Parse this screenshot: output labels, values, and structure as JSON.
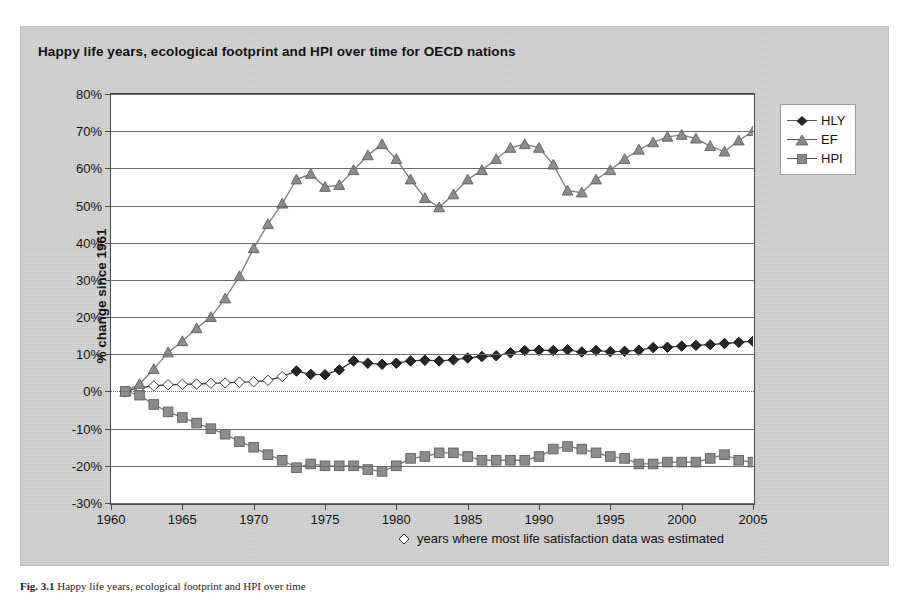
{
  "figure": {
    "title": "Happy life years, ecological footprint and HPI over time for OECD nations",
    "caption_label": "Fig. 3.1",
    "caption_text": "Happy life years, ecological footprint and HPI over time"
  },
  "footnote": {
    "symbol": "◇",
    "text": "years where most life satisfaction data was estimated"
  },
  "legend": {
    "position": "right",
    "items": [
      {
        "label": "HLY",
        "marker": "diamond",
        "color": "#262626"
      },
      {
        "label": "EF",
        "marker": "triangle",
        "color": "#7f7f7f"
      },
      {
        "label": "HPI",
        "marker": "square",
        "color": "#808080"
      }
    ]
  },
  "chart_data": {
    "type": "line",
    "title": "Happy life years, ecological footprint and HPI over time for OECD nations",
    "xlabel": "",
    "ylabel": "% change since 1961",
    "xlim": [
      1960,
      2005
    ],
    "ylim": [
      -30,
      80
    ],
    "ytick_values": [
      80,
      70,
      60,
      50,
      40,
      30,
      20,
      10,
      0,
      -10,
      -20,
      -30
    ],
    "ytick_labels": [
      "80%",
      "70%",
      "60%",
      "50%",
      "40%",
      "30%",
      "20%",
      "10%",
      "0%",
      "-10%",
      "-20%",
      "-30%"
    ],
    "xtick_values": [
      1960,
      1965,
      1970,
      1975,
      1980,
      1985,
      1990,
      1995,
      2000,
      2005
    ],
    "xtick_labels": [
      "1960",
      "1965",
      "1970",
      "1975",
      "1980",
      "1985",
      "1990",
      "1995",
      "2000",
      "2005"
    ],
    "grid": "horizontal",
    "legend_position": "right",
    "x": [
      1961,
      1962,
      1963,
      1964,
      1965,
      1966,
      1967,
      1968,
      1969,
      1970,
      1971,
      1972,
      1973,
      1974,
      1975,
      1976,
      1977,
      1978,
      1979,
      1980,
      1981,
      1982,
      1983,
      1984,
      1985,
      1986,
      1987,
      1988,
      1989,
      1990,
      1991,
      1992,
      1993,
      1994,
      1995,
      1996,
      1997,
      1998,
      1999,
      2000,
      2001,
      2002,
      2003,
      2004,
      2005
    ],
    "series": [
      {
        "name": "HLY",
        "marker": "diamond",
        "color": "#262626",
        "values": [
          0.0,
          1.0,
          1.5,
          1.8,
          1.9,
          2.0,
          2.2,
          2.3,
          2.5,
          2.6,
          3.0,
          4.0,
          5.5,
          4.6,
          4.5,
          5.8,
          8.2,
          7.6,
          7.3,
          7.6,
          8.2,
          8.4,
          8.2,
          8.5,
          9.0,
          9.4,
          9.6,
          10.4,
          11.0,
          11.1,
          11.0,
          11.2,
          10.6,
          11.0,
          10.7,
          10.8,
          11.1,
          11.8,
          11.9,
          12.2,
          12.4,
          12.6,
          12.9,
          13.2,
          13.5
        ],
        "estimated_until": 1972,
        "estimated_note": "open diamonds mark years where most life satisfaction data was estimated"
      },
      {
        "name": "EF",
        "marker": "triangle",
        "color": "#7f7f7f",
        "values": [
          0.0,
          2.0,
          6.0,
          10.5,
          13.5,
          17.0,
          20.0,
          25.0,
          31.0,
          38.5,
          45.0,
          50.5,
          57.0,
          58.5,
          55.0,
          55.5,
          59.5,
          63.5,
          66.5,
          62.5,
          57.0,
          52.0,
          49.5,
          53.0,
          57.0,
          59.5,
          62.5,
          65.5,
          66.5,
          65.5,
          61.0,
          54.0,
          53.5,
          57.0,
          59.5,
          62.5,
          65.0,
          67.0,
          68.5,
          69.0,
          68.0,
          66.0,
          64.5,
          67.5,
          70.0
        ]
      },
      {
        "name": "HPI",
        "marker": "square",
        "color": "#808080",
        "values": [
          0.0,
          -1.0,
          -3.5,
          -5.5,
          -7.0,
          -8.5,
          -10.0,
          -11.5,
          -13.5,
          -15.0,
          -17.0,
          -18.5,
          -20.5,
          -19.5,
          -20.0,
          -20.0,
          -20.0,
          -21.0,
          -21.5,
          -20.0,
          -18.0,
          -17.5,
          -16.5,
          -16.5,
          -17.5,
          -18.5,
          -18.5,
          -18.5,
          -18.5,
          -17.5,
          -15.5,
          -14.8,
          -15.5,
          -16.5,
          -17.5,
          -18.0,
          -19.5,
          -19.5,
          -19.0,
          -19.0,
          -19.0,
          -18.0,
          -17.0,
          -18.5,
          -19.0
        ]
      }
    ]
  }
}
